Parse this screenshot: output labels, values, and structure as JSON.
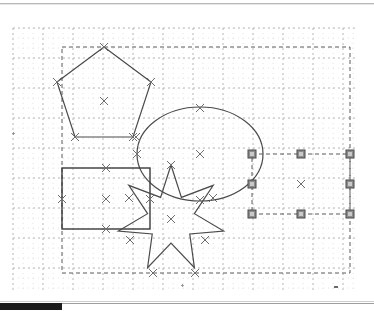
{
  "app": {
    "name": "vector-drawing-canvas",
    "background_color": "#ffffff"
  },
  "toolbar": {
    "separator_color": "#b9b9b9"
  },
  "canvas": {
    "label": "drawing-canvas",
    "width": 374,
    "height": 296,
    "grid": {
      "visible": true,
      "minor_spacing": 10,
      "major_spacing": 30,
      "minor_color": "#e2e2e2",
      "major_color": "#b5b5b5",
      "style": "dotted",
      "origin_x": 13,
      "origin_y": 22,
      "extent_x": 356,
      "extent_y": 286
    },
    "selection_box": {
      "visible": true,
      "x": 62,
      "y": 41,
      "width": 288,
      "height": 226,
      "stroke": "#5a5a5a",
      "dash": "4 3"
    },
    "node_marker": {
      "glyph": "x",
      "color": "#6e6e6e",
      "size": 8
    },
    "handle": {
      "fill": "#8c8c8c",
      "inner": "#c9c9c9",
      "stroke": "#4a4a4a",
      "size": 8,
      "count": 8
    }
  },
  "shapes": [
    {
      "id": "pentagon",
      "name": "pentagon-shape",
      "type": "polygon",
      "sides": 5,
      "stroke": "#4a4a4a",
      "fill": "none",
      "center": {
        "x": 104,
        "y": 95
      },
      "points": "104,41 151,76 133,131 75,131 57,76",
      "nodes": [
        {
          "x": 104,
          "y": 41
        },
        {
          "x": 151,
          "y": 76
        },
        {
          "x": 133,
          "y": 131
        },
        {
          "x": 75,
          "y": 131
        },
        {
          "x": 57,
          "y": 76
        }
      ]
    },
    {
      "id": "ellipse",
      "name": "ellipse-shape",
      "type": "ellipse",
      "stroke": "#4a4a4a",
      "fill": "none",
      "center": {
        "x": 200,
        "y": 148
      },
      "rx": 63,
      "ry": 47,
      "nodes": [
        {
          "x": 200,
          "y": 102
        },
        {
          "x": 137,
          "y": 148
        },
        {
          "x": 200,
          "y": 194
        },
        {
          "x": 136,
          "y": 131
        }
      ]
    },
    {
      "id": "rectangle",
      "name": "rectangle-shape",
      "type": "rect",
      "stroke": "#3a3a3a",
      "fill": "none",
      "x": 62,
      "y": 162,
      "width": 88,
      "height": 61,
      "center": {
        "x": 106,
        "y": 193
      },
      "nodes": [
        {
          "x": 106,
          "y": 162
        },
        {
          "x": 150,
          "y": 193
        },
        {
          "x": 106,
          "y": 223
        },
        {
          "x": 62,
          "y": 193
        }
      ]
    },
    {
      "id": "star",
      "name": "star-shape",
      "type": "star",
      "points_count": 7,
      "stroke": "#4a4a4a",
      "fill": "none",
      "center": {
        "x": 171,
        "y": 213
      },
      "outer_radius": 54,
      "inner_radius": 24,
      "nodes": [
        {
          "x": 171,
          "y": 159
        },
        {
          "x": 213,
          "y": 192
        },
        {
          "x": 205,
          "y": 234
        },
        {
          "x": 195,
          "y": 267
        },
        {
          "x": 153,
          "y": 267
        },
        {
          "x": 130,
          "y": 234
        },
        {
          "x": 129,
          "y": 192
        }
      ]
    },
    {
      "id": "selected-rect",
      "name": "selected-rectangle-shape",
      "type": "rect",
      "selected": true,
      "stroke": "#5a5a5a",
      "dash": "4 3",
      "fill": "none",
      "x": 252,
      "y": 148,
      "width": 98,
      "height": 60,
      "center": {
        "x": 301,
        "y": 178
      },
      "handles": [
        {
          "x": 252,
          "y": 148,
          "name": "handle-top-left"
        },
        {
          "x": 301,
          "y": 148,
          "name": "handle-top-center"
        },
        {
          "x": 350,
          "y": 148,
          "name": "handle-top-right"
        },
        {
          "x": 252,
          "y": 178,
          "name": "handle-middle-left"
        },
        {
          "x": 350,
          "y": 178,
          "name": "handle-middle-right"
        },
        {
          "x": 252,
          "y": 208,
          "name": "handle-bottom-left"
        },
        {
          "x": 301,
          "y": 208,
          "name": "handle-bottom-center"
        },
        {
          "x": 350,
          "y": 208,
          "name": "handle-bottom-right"
        }
      ]
    }
  ],
  "scrollbars": {
    "horizontal": {
      "name": "horizontal-scrollbar",
      "thumb_position": 0,
      "thumb_width": 62,
      "thumb_color": "#1c1c1c"
    },
    "vertical": {
      "name": "vertical-scrollbar",
      "visible": false
    }
  }
}
